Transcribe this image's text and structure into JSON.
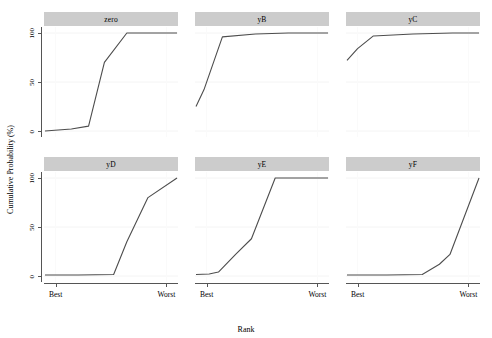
{
  "chart_data": {
    "type": "line",
    "title": "",
    "xlabel": "Rank",
    "ylabel": "Cumulative Probability (%)",
    "ylim": [
      0,
      100
    ],
    "xlim": [
      0,
      1
    ],
    "yticks": [
      0,
      50,
      100
    ],
    "ytick_labels": [
      "0",
      "50",
      "100"
    ],
    "xtick_labels": [
      "Best",
      "Worst"
    ],
    "xtick_positions": [
      0.08,
      0.92
    ],
    "grid": true,
    "legend": "none",
    "layout": {
      "rows": 2,
      "cols": 3
    },
    "line_color": "#4d4d4d",
    "strip_color": "#cccccc",
    "panels": [
      {
        "label": "zero",
        "x": [
          0.0,
          0.2,
          0.33,
          0.45,
          0.62,
          0.78,
          1.0
        ],
        "y": [
          0.0,
          2.0,
          5.0,
          70.0,
          100.0,
          100.0,
          100.0
        ]
      },
      {
        "label": "yB",
        "x": [
          0.0,
          0.06,
          0.2,
          0.45,
          0.7,
          1.0
        ],
        "y": [
          25.0,
          42.0,
          96.0,
          99.0,
          100.0,
          100.0
        ]
      },
      {
        "label": "yC",
        "x": [
          0.0,
          0.08,
          0.2,
          0.5,
          0.8,
          1.0
        ],
        "y": [
          72.0,
          84.0,
          97.0,
          99.0,
          100.0,
          100.0
        ]
      },
      {
        "label": "yD",
        "x": [
          0.0,
          0.25,
          0.52,
          0.62,
          0.78,
          1.0
        ],
        "y": [
          1.0,
          1.0,
          1.5,
          35.0,
          80.0,
          100.0
        ]
      },
      {
        "label": "yE",
        "x": [
          0.0,
          0.1,
          0.17,
          0.3,
          0.42,
          0.6,
          0.8,
          1.0
        ],
        "y": [
          1.5,
          2.0,
          4.0,
          22.0,
          38.0,
          100.0,
          100.0,
          100.0
        ]
      },
      {
        "label": "yF",
        "x": [
          0.0,
          0.3,
          0.57,
          0.7,
          0.78,
          1.0
        ],
        "y": [
          1.0,
          1.0,
          1.5,
          12.0,
          22.0,
          100.0
        ]
      }
    ]
  }
}
